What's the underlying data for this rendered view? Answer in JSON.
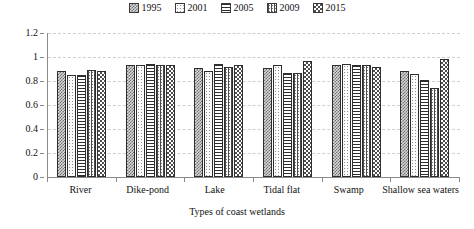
{
  "chart_data": {
    "type": "bar",
    "title": "",
    "xlabel": "Types of coast wetlands",
    "ylabel": "",
    "ylim": [
      0,
      1.2
    ],
    "yticks": [
      "0",
      "0.2",
      "0.4",
      "0.6",
      "0.8",
      "1",
      "1.2"
    ],
    "ytick_values": [
      0,
      0.2,
      0.4,
      0.6,
      0.8,
      1.0,
      1.2
    ],
    "grid": true,
    "legend_position": "top-center",
    "categories": [
      "River",
      "Dike-pond",
      "Lake",
      "Tidal flat",
      "Swamp",
      "Shallow sea waters"
    ],
    "series": [
      {
        "name": "1995",
        "pattern": "checkerboard-gray",
        "values": [
          0.88,
          0.93,
          0.91,
          0.91,
          0.93,
          0.88
        ]
      },
      {
        "name": "2001",
        "pattern": "light-dots",
        "values": [
          0.85,
          0.93,
          0.88,
          0.93,
          0.94,
          0.86
        ]
      },
      {
        "name": "2005",
        "pattern": "horizontal-lines",
        "values": [
          0.85,
          0.94,
          0.94,
          0.87,
          0.93,
          0.81
        ]
      },
      {
        "name": "2009",
        "pattern": "vertical-dotted",
        "values": [
          0.89,
          0.93,
          0.92,
          0.87,
          0.93,
          0.74
        ]
      },
      {
        "name": "2015",
        "pattern": "checkerboard-dark",
        "values": [
          0.88,
          0.93,
          0.93,
          0.97,
          0.92,
          0.98
        ]
      }
    ]
  },
  "colors": {
    "axis": "#8a8a8a",
    "grid": "#cfcfcf",
    "bar_edge": "#2e2e2e",
    "text": "#111111",
    "background": "#ffffff"
  }
}
